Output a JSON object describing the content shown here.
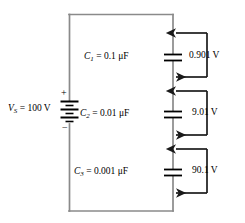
{
  "figure": {
    "background_color": "#ffffff",
    "wire_color": "#808080",
    "component_color": "#000000",
    "annotation_color": "#1a1a1a"
  },
  "source": {
    "name": "voltage-source",
    "label_symbol": "V",
    "label_subscript": "S",
    "label_equals": " = 100 V",
    "full_label": "VS = 100 V",
    "value": "100 V",
    "plus_sign": "+",
    "minus_sign": "−",
    "symbol_type": "battery"
  },
  "capacitors": [
    {
      "name": "capacitor-c1",
      "symbol": "C",
      "subscript": "1",
      "equals": " = 0.1 μF",
      "full_label": "C1 = 0.1 μF",
      "value": "0.1 μF"
    },
    {
      "name": "capacitor-c2",
      "symbol": "C",
      "subscript": "2",
      "equals": " = 0.01 μF",
      "full_label": "C2 = 0.01 μF",
      "value": "0.01 μF"
    },
    {
      "name": "capacitor-c3",
      "symbol": "C",
      "subscript": "3",
      "equals": " = 0.001 μF",
      "full_label": "C3 = 0.001 μF",
      "value": "0.001 μF"
    }
  ],
  "voltage_drops": [
    {
      "name": "voltage-drop-c1",
      "label": "0.901 V",
      "across": "C1"
    },
    {
      "name": "voltage-drop-c2",
      "label": "9.01 V",
      "across": "C2"
    },
    {
      "name": "voltage-drop-c3",
      "label": "90.1 V",
      "across": "C3"
    }
  ]
}
